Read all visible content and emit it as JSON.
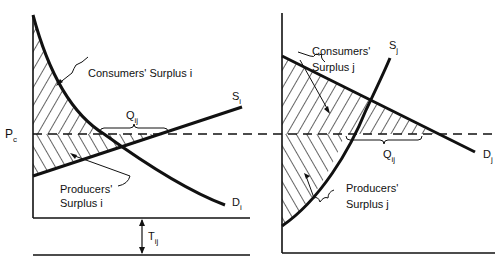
{
  "diagram": {
    "left_panel": {
      "price_label": "P",
      "price_sub": "c",
      "supply_label": "S",
      "supply_sub": "i",
      "demand_label": "D",
      "demand_sub": "i",
      "consumers_surplus": "Consumers' Surplus i",
      "producers_surplus_line1": "Producers'",
      "producers_surplus_line2": "Surplus i",
      "quantity_label": "Q",
      "quantity_sub": "ij",
      "transport_label": "T",
      "transport_sub": "ij"
    },
    "right_panel": {
      "supply_label": "S",
      "supply_sub": "j",
      "demand_label": "D",
      "demand_sub": "j",
      "consumers_surplus_line1": "Consumers'",
      "consumers_surplus_line2": "Surplus j",
      "producers_surplus_line1": "Producers'",
      "producers_surplus_line2": "Surplus j",
      "quantity_label": "Q",
      "quantity_sub": "ij"
    }
  }
}
